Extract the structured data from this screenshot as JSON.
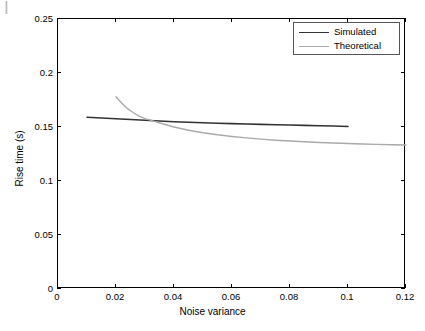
{
  "figure": {
    "width": 425,
    "height": 331,
    "background": "#ffffff",
    "artifact_name": "corner-speck"
  },
  "chart_data": {
    "type": "line",
    "title": "",
    "xlabel": "Noise variance",
    "ylabel": "Rise time (s)",
    "xlim": [
      0,
      0.12
    ],
    "ylim": [
      0,
      0.25
    ],
    "xticks": [
      0,
      0.02,
      0.04,
      0.06,
      0.08,
      0.1,
      0.12
    ],
    "xticklabels": [
      "0",
      "0.02",
      "0.04",
      "0.06",
      "0.08",
      "0.1",
      "0.12"
    ],
    "yticks": [
      0,
      0.05,
      0.1,
      0.15,
      0.2,
      0.25
    ],
    "yticklabels": [
      "0",
      "0.05",
      "0.1",
      "0.15",
      "0.2",
      "0.25"
    ],
    "grid": false,
    "legend_position": "upper right",
    "crossing_point": {
      "x": 0.033,
      "y": 0.1555
    },
    "series": [
      {
        "name": "Simulated",
        "color": "#333333",
        "linewidth": 1.6,
        "x": [
          0.01,
          0.015,
          0.02,
          0.025,
          0.03,
          0.035,
          0.04,
          0.045,
          0.05,
          0.055,
          0.06,
          0.065,
          0.07,
          0.075,
          0.08,
          0.085,
          0.09,
          0.095,
          0.1
        ],
        "y": [
          0.159,
          0.1583,
          0.1576,
          0.1569,
          0.1562,
          0.1555,
          0.1549,
          0.1544,
          0.1539,
          0.1535,
          0.1531,
          0.1528,
          0.1524,
          0.1521,
          0.1518,
          0.1515,
          0.1512,
          0.1509,
          0.1505
        ]
      },
      {
        "name": "Theoretical",
        "color": "#aaaaaa",
        "linewidth": 1.4,
        "x": [
          0.02,
          0.022,
          0.024,
          0.026,
          0.028,
          0.03,
          0.033,
          0.036,
          0.04,
          0.045,
          0.05,
          0.055,
          0.06,
          0.065,
          0.07,
          0.075,
          0.08,
          0.085,
          0.09,
          0.095,
          0.1,
          0.105,
          0.11,
          0.115,
          0.12
        ],
        "y": [
          0.178,
          0.172,
          0.167,
          0.1632,
          0.16,
          0.1578,
          0.1555,
          0.153,
          0.15,
          0.147,
          0.1447,
          0.1428,
          0.1412,
          0.1399,
          0.1388,
          0.1378,
          0.137,
          0.1363,
          0.1357,
          0.1352,
          0.1347,
          0.1343,
          0.1339,
          0.1336,
          0.1333
        ]
      }
    ]
  },
  "legend": {
    "items": [
      {
        "label": "Simulated",
        "color": "#333333"
      },
      {
        "label": "Theoretical",
        "color": "#aaaaaa"
      }
    ]
  }
}
